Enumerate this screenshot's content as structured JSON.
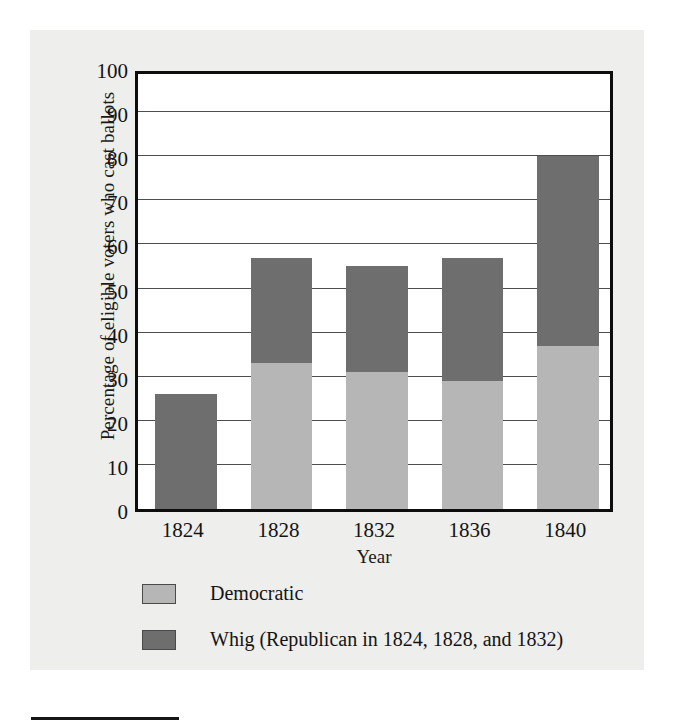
{
  "chart_data": {
    "type": "bar",
    "subtype": "stacked-bar",
    "title": "",
    "xlabel": "Year",
    "ylabel": "Percentage of eligible voters who cast ballots",
    "categories": [
      "1824",
      "1828",
      "1832",
      "1836",
      "1840"
    ],
    "series": [
      {
        "name": "Democratic",
        "color": "#b6b6b6",
        "values": [
          0,
          33,
          31,
          29,
          37
        ]
      },
      {
        "name": "Whig (Republican in 1824, 1828, and 1832)",
        "color": "#6e6e6e",
        "values": [
          26,
          24,
          24,
          28,
          43
        ]
      }
    ],
    "totals": [
      26,
      57,
      55,
      57,
      80
    ],
    "ylim": [
      0,
      100
    ],
    "yticks": [
      0,
      10,
      20,
      30,
      40,
      50,
      60,
      70,
      80,
      90,
      100
    ],
    "ytick_labels": [
      "0",
      "10",
      "20",
      "30",
      "40",
      "50",
      "60",
      "70",
      "80",
      "90",
      "100"
    ],
    "grid": true,
    "grid_axis": "y",
    "legend_position": "bottom-left",
    "legend_entries": [
      {
        "label": "Democratic",
        "color": "#b6b6b6"
      },
      {
        "label": "Whig (Republican in 1824, 1828, and 1832)",
        "color": "#6e6e6e"
      }
    ]
  },
  "axis": {
    "y_title": "Percentage of eligible voters who cast ballots",
    "x_title": "Year"
  },
  "colors": {
    "democratic": "#b6b6b6",
    "whig": "#6e6e6e",
    "panel_background": "#eeeeec",
    "plot_background": "#ffffff",
    "axis_line": "#0d0d0d",
    "gridline": "#4d4d4d"
  }
}
